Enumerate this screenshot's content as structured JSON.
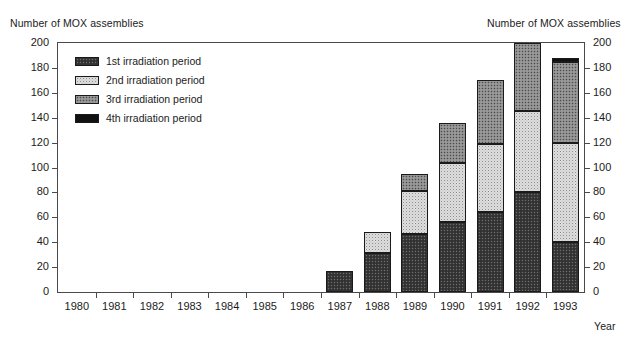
{
  "chart_data": {
    "type": "bar",
    "stacked": true,
    "title": "",
    "ylabel": "Number of MOX assemblies",
    "ylabel_right": "Number of MOX assemblies",
    "xlabel": "Year",
    "ylim": [
      0,
      200
    ],
    "ytick_step": 20,
    "yticks": [
      0,
      20,
      40,
      60,
      80,
      100,
      120,
      140,
      160,
      180,
      200
    ],
    "grid": false,
    "legend_position": "top-left-inside",
    "categories": [
      "1980",
      "1981",
      "1982",
      "1983",
      "1984",
      "1985",
      "1986",
      "1987",
      "1988",
      "1989",
      "1990",
      "1991",
      "1992",
      "1993"
    ],
    "series": [
      {
        "name": "1st irradiation period",
        "pattern": "dark-dither",
        "values": [
          0,
          0,
          0,
          0,
          0,
          0,
          0,
          17,
          31,
          47,
          56,
          64,
          80,
          40
        ]
      },
      {
        "name": "2nd irradiation period",
        "pattern": "light-dither",
        "values": [
          0,
          0,
          0,
          0,
          0,
          0,
          0,
          0,
          17,
          34,
          48,
          55,
          65,
          80
        ]
      },
      {
        "name": "3rd irradiation period",
        "pattern": "medium-dither",
        "values": [
          0,
          0,
          0,
          0,
          0,
          0,
          0,
          0,
          0,
          14,
          32,
          51,
          55,
          65
        ]
      },
      {
        "name": "4th irradiation period",
        "pattern": "solid-black",
        "values": [
          0,
          0,
          0,
          0,
          0,
          0,
          0,
          0,
          0,
          0,
          0,
          0,
          0,
          3
        ]
      }
    ],
    "totals": [
      0,
      0,
      0,
      0,
      0,
      0,
      0,
      17,
      48,
      95,
      136,
      170,
      200,
      188
    ]
  },
  "legend": {
    "items": [
      {
        "label": "1st irradiation period",
        "pattern": "dark-dither"
      },
      {
        "label": "2nd irradiation period",
        "pattern": "light-dither"
      },
      {
        "label": "3rd irradiation period",
        "pattern": "medium-dither"
      },
      {
        "label": "4th irradiation period",
        "pattern": "solid-black"
      }
    ]
  },
  "colors": {
    "axis": "#4a4a4a",
    "text": "#1b1b1b",
    "series_1st": "#3a3a3a",
    "series_2nd": "#dedede",
    "series_3rd": "#8a8a8a",
    "series_4th": "#111111"
  }
}
